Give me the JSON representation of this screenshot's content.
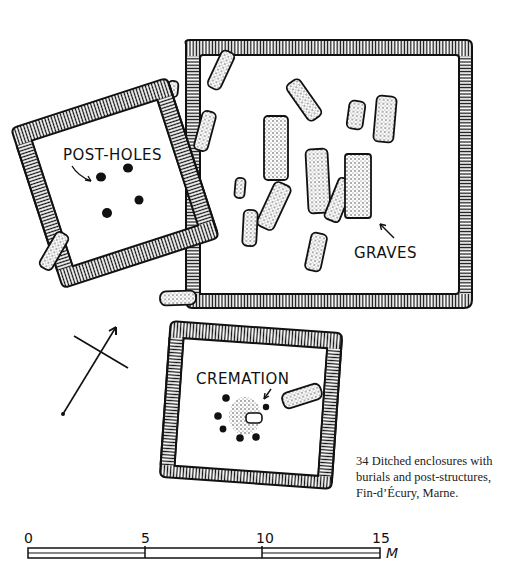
{
  "figure": {
    "number": "34",
    "caption_lines": [
      "34  Ditched enclosures with",
      "burials and post-structures,",
      "Fin-d’Écury, Marne."
    ]
  },
  "labels": {
    "post_holes": "POST-HOLES",
    "graves": "GRAVES",
    "cremation": "CREMATION"
  },
  "scale_bar": {
    "ticks": [
      "0",
      "5",
      "10",
      "15"
    ],
    "unit": "M"
  },
  "colors": {
    "ink": "#111111",
    "paper": "#ffffff"
  },
  "north_arrow": {
    "icon": "north-arrow-icon"
  }
}
